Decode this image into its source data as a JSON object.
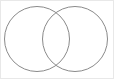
{
  "figure": {
    "canvas": {
      "width": 114,
      "height": 79,
      "background_color": "#ffffff"
    },
    "frame": {
      "visible": true,
      "color": "#e8e8e8",
      "stroke_width": 1
    },
    "shapes": [
      {
        "name": "left-circle",
        "label": "",
        "cx": 37,
        "cy": 39,
        "r": 33,
        "stroke_color": "#8a8a8a",
        "stroke_width": 1,
        "fill": "none"
      },
      {
        "name": "right-circle",
        "label": "",
        "cx": 75,
        "cy": 39,
        "r": 33,
        "stroke_color": "#8a8a8a",
        "stroke_width": 1,
        "fill": "none"
      }
    ],
    "intersection": {
      "name": "lens-region",
      "label": "",
      "fill": "none",
      "top_crossing": "56,11",
      "bottom_crossing": "56,67"
    }
  }
}
